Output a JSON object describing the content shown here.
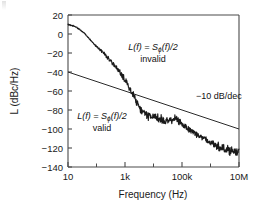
{
  "chart_data": {
    "type": "line",
    "title": "",
    "xlabel": "Frequency (Hz)",
    "ylabel": "L (dBc/Hz)",
    "xscale": "log",
    "xlim": [
      10,
      10000000
    ],
    "ylim": [
      -140,
      20
    ],
    "yticks": [
      20,
      0,
      -20,
      -40,
      -60,
      -80,
      -100,
      -120,
      -140
    ],
    "ytick_labels": [
      "20",
      "0",
      "−20",
      "−40",
      "−60",
      "−80",
      "−100",
      "−120",
      "−140"
    ],
    "xticks": [
      10,
      100,
      1000,
      10000,
      100000,
      1000000,
      10000000
    ],
    "xtick_labels": [
      "10",
      "",
      "1k",
      "",
      "100k",
      "",
      "10M"
    ],
    "grid": false,
    "legend": "none",
    "series": [
      {
        "name": "measured phase noise",
        "style": "noisy-line",
        "x": [
          10,
          14,
          20,
          28,
          40,
          56,
          80,
          110,
          160,
          220,
          320,
          450,
          640,
          900,
          1300,
          1800,
          2600,
          3600,
          5200,
          7200,
          10000,
          14000,
          20000,
          28000,
          40000,
          56000,
          80000,
          110000,
          160000,
          220000,
          320000,
          450000,
          640000,
          900000,
          1300000,
          1800000,
          2600000,
          3600000,
          5200000,
          7200000,
          10000000
        ],
        "y": [
          10,
          9,
          7,
          4,
          0,
          -5,
          -10,
          -14,
          -19,
          -23,
          -29,
          -34,
          -40,
          -46,
          -54,
          -62,
          -72,
          -80,
          -85,
          -87,
          -86,
          -88,
          -90,
          -92,
          -91,
          -89,
          -92,
          -96,
          -99,
          -102,
          -105,
          -108,
          -111,
          -114,
          -116,
          -118,
          -120,
          -121,
          -123,
          -124,
          -125
        ]
      },
      {
        "name": "−10 dB/dec asymptote",
        "style": "straight-line",
        "x": [
          10,
          10000000
        ],
        "y": [
          -40,
          -100
        ]
      }
    ],
    "annotations": [
      {
        "name": "invalid-region-label",
        "line1_prefix": "L(f) = S",
        "line1_sub": "ϕ",
        "line1_suffix": "(f)/2",
        "line2": "invalid",
        "x_frac": 0.56,
        "y_frac": 0.22
      },
      {
        "name": "valid-region-label",
        "line1_prefix": "L(f) = S",
        "line1_sub": "ϕ",
        "line1_suffix": "(f)/2",
        "line2": "valid",
        "x_frac": 0.3,
        "y_frac": 0.65
      },
      {
        "name": "slope-label",
        "text": "−10 dB/dec",
        "x_frac": 0.8,
        "y_frac": 0.52
      }
    ]
  },
  "axes": {
    "y_title": "L (dBc/Hz)",
    "x_title": "Frequency (Hz)",
    "y_labels": [
      "20",
      "0",
      "−20",
      "−40",
      "−60",
      "−80",
      "−100",
      "−120",
      "−140"
    ],
    "x_labels": [
      "10",
      "1k",
      "100k",
      "10M"
    ]
  },
  "annotations": {
    "invalid": {
      "formula_prefix": "L(f) = S",
      "formula_sub": "ϕ",
      "formula_suffix": "(f)/2",
      "status": "invalid"
    },
    "valid": {
      "formula_prefix": "L(f) = S",
      "formula_sub": "ϕ",
      "formula_suffix": "(f)/2",
      "status": "valid"
    },
    "slope": "−10 dB/dec"
  },
  "colors": {
    "trace": "#1a1a1a",
    "axis": "#4a4a4a",
    "background": "#ffffff"
  }
}
